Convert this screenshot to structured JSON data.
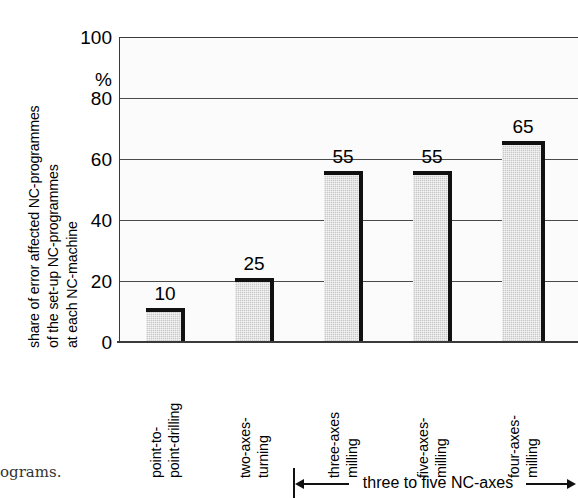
{
  "chart_data": {
    "type": "bar",
    "title": "",
    "categories": [
      "point-to-\npoint-drilling",
      "two-axes-\nturning",
      "three-axes\nmilling",
      "five-axes-\nmilling",
      "four-axes-\nmilling"
    ],
    "category_lines": [
      [
        "point-to-",
        "point-drilling"
      ],
      [
        "two-axes-",
        "turning"
      ],
      [
        "three-axes",
        "milling"
      ],
      [
        "five-axes-",
        "milling"
      ],
      [
        "four-axes-",
        "milling"
      ]
    ],
    "values": [
      10,
      25,
      55,
      55,
      65
    ],
    "value_labels": [
      "10",
      "25",
      "55",
      "55",
      "65"
    ],
    "bar_top_pixels": [
      11,
      21,
      56,
      56,
      66
    ],
    "xlabel": "",
    "ylabel": "share of error affected NC-programmes of the set-up NC-programmes at each NC-machine",
    "ylabel_lines": [
      "share of error affected NC-programmes",
      "of the set-up NC-programmes",
      "at each NC-machine"
    ],
    "yunit": "%",
    "ylim": [
      0,
      100
    ],
    "yticks": [
      0,
      20,
      40,
      60,
      80,
      100
    ],
    "ytick_labels": [
      "0",
      "20",
      "40",
      "60",
      "80",
      "100"
    ],
    "grid": true,
    "grid_axis": "y",
    "legend": "none",
    "annotations": [
      {
        "name": "range-bracket",
        "text": "three to five NC-axes",
        "spans_categories": [
          "three-axes milling",
          "five-axes-milling",
          "four-axes-milling"
        ],
        "arrow": "double-headed"
      }
    ],
    "colors": {
      "bar_fill": "#c8c8c8",
      "bar_outline": "#111111",
      "plot_background": "#fbfbfb",
      "gridline": "#4a4a4a",
      "axis": "#3a3a3a",
      "text": "#000000"
    }
  },
  "caption": {
    "fragment": "ograms."
  }
}
